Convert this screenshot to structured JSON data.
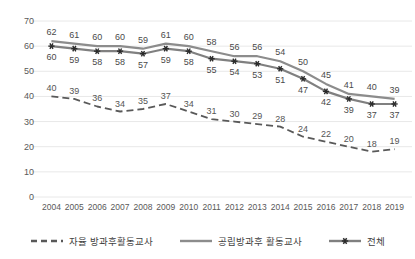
{
  "chart_data": {
    "type": "line",
    "title": "",
    "subtitle": "",
    "xlabel": "",
    "ylabel": "",
    "ylim": [
      0,
      70
    ],
    "ytick_step": 10,
    "grid": true,
    "legend_position": "bottom",
    "categories": [
      "2004",
      "2005",
      "2006",
      "2007",
      "2008",
      "2009",
      "2010",
      "2011",
      "2012",
      "2013",
      "2014",
      "2015",
      "2016",
      "2017",
      "2018",
      "2019"
    ],
    "yticks": [
      "0",
      "10",
      "20",
      "30",
      "40",
      "50",
      "60",
      "70"
    ],
    "series": [
      {
        "name": "자율 방과후활동교사",
        "style": "dashed",
        "marker": "none",
        "color": "#595959",
        "values": [
          40,
          39,
          36,
          34,
          35,
          37,
          34,
          31,
          30,
          29,
          28,
          24,
          22,
          20,
          18,
          19
        ]
      },
      {
        "name": "공립방과후 활동교사",
        "style": "solid",
        "marker": "none",
        "color": "#8c8c8c",
        "values": [
          62,
          61,
          60,
          60,
          59,
          61,
          60,
          58,
          56,
          56,
          54,
          50,
          45,
          41,
          40,
          39
        ]
      },
      {
        "name": "전체",
        "style": "solid",
        "marker": "asterisk",
        "color": "#808080",
        "values": [
          60,
          59,
          58,
          58,
          57,
          59,
          58,
          55,
          54,
          53,
          51,
          47,
          42,
          39,
          37,
          37
        ]
      }
    ]
  },
  "colors": {
    "background": "#ffffff",
    "gridline": "#e8e8e8",
    "axis_text": "#595959",
    "data_label": "#4a4a4a",
    "series_dashed": "#595959",
    "series_solid": "#8c8c8c",
    "series_total": "#808080"
  }
}
